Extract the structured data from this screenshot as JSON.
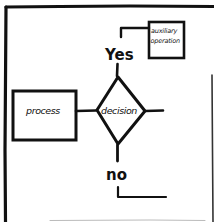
{
  "diagram": {
    "type": "hand-drawn flowchart fragment",
    "stroke_color": "#111111",
    "background": "#ffffff",
    "nodes": {
      "process": {
        "label": "process",
        "shape": "rectangle"
      },
      "decision": {
        "label": "decision",
        "shape": "diamond"
      },
      "auxiliary": {
        "label_line1": "auxiliary",
        "label_line2": "operation",
        "shape": "rectangle"
      }
    },
    "branches": {
      "yes": {
        "label": "Yes"
      },
      "no": {
        "label": "no"
      }
    },
    "edges": [
      {
        "from": "process",
        "to": "decision"
      },
      {
        "from": "decision",
        "to": "yes-branch",
        "label": "Yes"
      },
      {
        "from": "yes-branch",
        "to": "auxiliary"
      },
      {
        "from": "decision",
        "to": "right-exit"
      },
      {
        "from": "decision",
        "to": "no-branch",
        "label": "no"
      },
      {
        "from": "no-branch",
        "to": "bottom-exit"
      }
    ]
  }
}
